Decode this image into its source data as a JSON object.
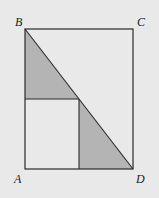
{
  "diagram": {
    "type": "geometry",
    "colors": {
      "background": "#e9e9e9",
      "line": "#2a2a2a",
      "shade": "#b4b4b4",
      "white_region": "#efefef"
    },
    "points": {
      "A": {
        "label": "A",
        "x": 25,
        "y": 169
      },
      "B": {
        "label": "B",
        "x": 25,
        "y": 29
      },
      "C": {
        "label": "C",
        "x": 133,
        "y": 29
      },
      "D": {
        "label": "D",
        "x": 133,
        "y": 169
      },
      "P": {
        "label": "",
        "x": 79,
        "y": 99
      }
    },
    "labels": {
      "A": "A",
      "B": "B",
      "C": "C",
      "D": "D"
    },
    "shaded_regions": [
      {
        "name": "upper-left triangle",
        "vertices": [
          "B",
          "P",
          "(25,99)"
        ]
      },
      {
        "name": "lower-right triangle",
        "vertices": [
          "P",
          "D",
          "(79,169)"
        ]
      }
    ]
  }
}
